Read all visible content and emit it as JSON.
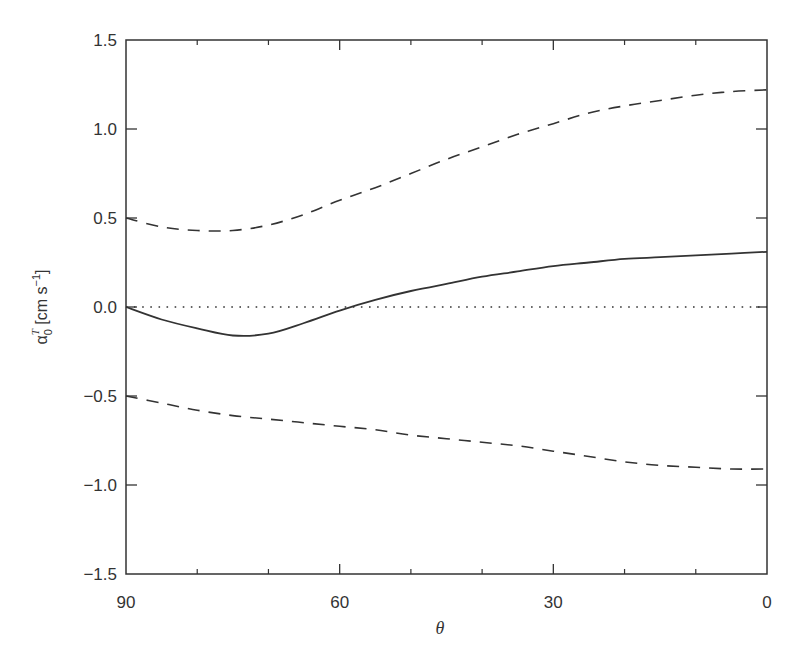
{
  "chart_data": {
    "type": "line",
    "title": "",
    "xlabel": "θ",
    "ylabel": "α0T [cm s−1]",
    "ylabel_parts": {
      "symbol": "α",
      "subscript": "0",
      "superscript": "T",
      "units_open": " [cm s",
      "units_sup": "−1",
      "units_close": "]"
    },
    "xlim": [
      90,
      0
    ],
    "ylim": [
      -1.5,
      1.5
    ],
    "x_reversed": true,
    "xticks": [
      90,
      60,
      30,
      0
    ],
    "xtick_labels": [
      "90",
      "60",
      "30",
      "0"
    ],
    "x_minor_ticks": [
      80,
      70,
      50,
      40,
      20,
      10
    ],
    "yticks": [
      1.5,
      1.0,
      0.5,
      0.0,
      -0.5,
      -1.0,
      -1.5
    ],
    "ytick_labels": [
      "1.5",
      "1.0",
      "0.5",
      "0.0",
      "−0.5",
      "−1.0",
      "−1.5"
    ],
    "grid": false,
    "legend": null,
    "x": [
      90,
      85,
      80,
      75,
      70,
      65,
      60,
      55,
      50,
      45,
      40,
      35,
      30,
      25,
      20,
      15,
      10,
      5,
      0
    ],
    "series": [
      {
        "name": "upper bound",
        "style": "dashed",
        "values": [
          0.5,
          0.45,
          0.43,
          0.43,
          0.46,
          0.52,
          0.6,
          0.67,
          0.75,
          0.83,
          0.9,
          0.97,
          1.03,
          1.09,
          1.13,
          1.16,
          1.19,
          1.21,
          1.22
        ]
      },
      {
        "name": "alpha_0^T",
        "style": "solid",
        "values": [
          0.0,
          -0.07,
          -0.12,
          -0.16,
          -0.15,
          -0.09,
          -0.02,
          0.04,
          0.09,
          0.13,
          0.17,
          0.2,
          0.23,
          0.25,
          0.27,
          0.28,
          0.29,
          0.3,
          0.31
        ]
      },
      {
        "name": "lower bound",
        "style": "dashed",
        "values": [
          -0.5,
          -0.54,
          -0.58,
          -0.61,
          -0.63,
          -0.65,
          -0.67,
          -0.69,
          -0.72,
          -0.74,
          -0.76,
          -0.78,
          -0.81,
          -0.84,
          -0.87,
          -0.89,
          -0.9,
          -0.91,
          -0.91
        ]
      },
      {
        "name": "zero reference",
        "style": "dotted",
        "values": [
          0,
          0,
          0,
          0,
          0,
          0,
          0,
          0,
          0,
          0,
          0,
          0,
          0,
          0,
          0,
          0,
          0,
          0,
          0
        ]
      }
    ],
    "colors": {
      "line": "#333333",
      "frame": "#333333",
      "background": "#ffffff"
    }
  }
}
